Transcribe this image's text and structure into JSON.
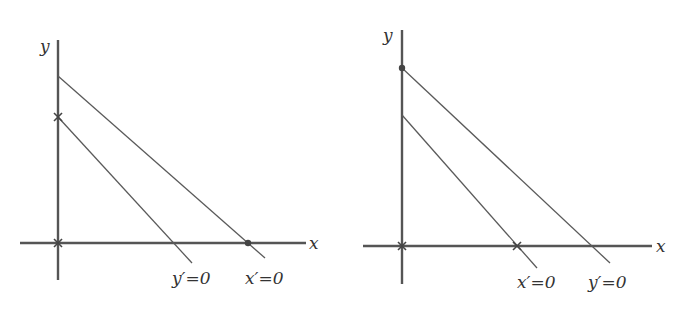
{
  "figure": {
    "panels": [
      {
        "id": "left",
        "axes": {
          "x_label": "x",
          "y_label": "y"
        },
        "lines": [
          {
            "name": "upper",
            "label": "x′=0"
          },
          {
            "name": "lower",
            "label": "y′=0"
          }
        ],
        "markers": [
          {
            "type": "cross",
            "location": "origin"
          },
          {
            "type": "cross",
            "location": "y-intercept of y′=0 line"
          },
          {
            "type": "dot",
            "location": "x-intercept of x′=0 line"
          }
        ]
      },
      {
        "id": "right",
        "axes": {
          "x_label": "x",
          "y_label": "y"
        },
        "lines": [
          {
            "name": "upper",
            "label": "y′=0"
          },
          {
            "name": "lower",
            "label": "x′=0"
          }
        ],
        "markers": [
          {
            "type": "cross",
            "location": "origin"
          },
          {
            "type": "dot",
            "location": "y-intercept of y′=0 line"
          },
          {
            "type": "cross",
            "location": "x-intercept of x′=0 line"
          }
        ]
      }
    ]
  }
}
